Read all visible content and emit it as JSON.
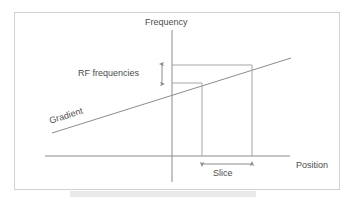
{
  "figure": {
    "type": "diagram",
    "background_color": "#ffffff",
    "frame_color": "#d2d2d2",
    "line_color": "#8c8c8c",
    "text_color": "#4d4d4d",
    "labels": {
      "y_axis": "Frequency",
      "x_axis": "Position",
      "gradient": "Gradient",
      "rf_bandwidth": "RF frequencies",
      "slice": "Slice"
    },
    "axes": {
      "y_axis_x": 172,
      "y_axis_top": 30,
      "y_axis_bottom": 182,
      "x_axis_y": 156,
      "x_axis_left": 45,
      "x_axis_right": 290
    },
    "gradient_line": {
      "x1": 52,
      "y1": 133,
      "x2": 291,
      "y2": 58,
      "rotation_deg": -17.4
    },
    "projection_lines": {
      "upper_frequency_y": 65,
      "lower_frequency_y": 83,
      "slice_left_x": 202,
      "slice_right_x": 252
    },
    "rf_arrow": {
      "x": 162,
      "y_top": 64,
      "y_bottom": 84
    },
    "slice_arrow": {
      "y": 164,
      "x_left": 202,
      "x_right": 252
    },
    "bottom_band": {
      "x": 70,
      "y": 191,
      "width": 186,
      "height": 6,
      "color": "#e9e9ea"
    }
  }
}
